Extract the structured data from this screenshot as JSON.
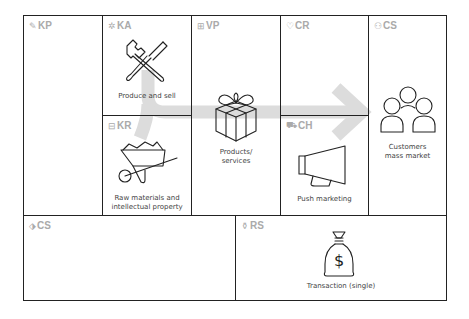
{
  "colors": {
    "border": "#222222",
    "header_text": "#aaaaaa",
    "caption_text": "#444444",
    "flow_arrow": "#dddddd"
  },
  "blocks": {
    "kp": {
      "code": "KP",
      "icon": "link-icon",
      "glyph": "✎",
      "caption": ""
    },
    "ka": {
      "code": "KA",
      "icon": "tools-icon",
      "glyph": "✲",
      "caption": "Produce and sell",
      "illustration": "wrench-screwdriver-icon"
    },
    "kr": {
      "code": "KR",
      "icon": "factory-icon",
      "glyph": "⊟",
      "caption_line1": "Raw materials and",
      "caption_line2": "intellectual property",
      "illustration": "wheelbarrow-icon"
    },
    "vp": {
      "code": "VP",
      "icon": "gift-icon",
      "glyph": "⊞",
      "caption_line1": "Products/",
      "caption_line2": "services",
      "illustration": "gift-box-icon"
    },
    "cr": {
      "code": "CR",
      "icon": "heart-icon",
      "glyph": "♡",
      "caption": ""
    },
    "ch": {
      "code": "CH",
      "icon": "truck-icon",
      "glyph": "⛟",
      "caption": "Push marketing",
      "illustration": "megaphone-icon"
    },
    "cs": {
      "code": "CS",
      "icon": "people-icon",
      "glyph": "⚇",
      "caption_line1": "Customers",
      "caption_line2": "mass market",
      "illustration": "customers-group-icon"
    },
    "cost": {
      "code": "CS",
      "icon": "tag-icon",
      "glyph": "⬗",
      "caption": ""
    },
    "rs": {
      "code": "RS",
      "icon": "money-bag-icon",
      "glyph": "⚱",
      "caption": "Transaction (single)",
      "illustration": "money-bag-dollar-icon",
      "currency_symbol": "$"
    }
  }
}
